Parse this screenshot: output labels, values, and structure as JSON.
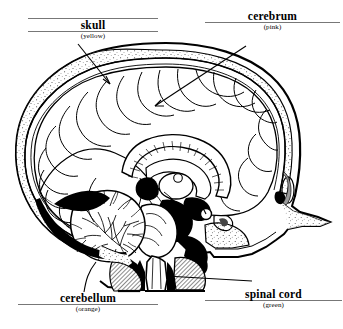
{
  "figure": {
    "style": "black-and-white line drawing",
    "labels": [
      {
        "id": "skull",
        "name": "skull",
        "color_note": "(yellow)"
      },
      {
        "id": "cerebrum",
        "name": "cerebrum",
        "color_note": "(pink)"
      },
      {
        "id": "cerebellum",
        "name": "cerebellum",
        "color_note": "(orange)"
      },
      {
        "id": "spinal_cord",
        "name": "spinal cord",
        "color_note": "(green)"
      }
    ],
    "colors": {
      "ink": "#000000",
      "paper": "#ffffff",
      "rule": "#777777",
      "shading": "#9a9a9a"
    }
  }
}
